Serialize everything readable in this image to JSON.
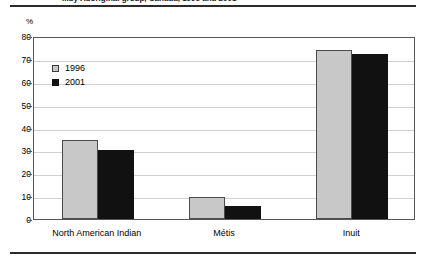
{
  "figure": {
    "title": "...by Aboriginal group, Canada, 1996 and 2001",
    "y_unit": "%"
  },
  "legend": {
    "entries": [
      {
        "label": "1996",
        "color": "#c8c8c8",
        "swatch": "gray-square-icon"
      },
      {
        "label": "2001",
        "color": "#111111",
        "swatch": "black-square-icon"
      }
    ]
  },
  "y_axis": {
    "ticks": [
      "0",
      "10",
      "20",
      "30",
      "40",
      "50",
      "60",
      "70",
      "80"
    ]
  },
  "chart_data": {
    "type": "bar",
    "title": "...by Aboriginal group, Canada, 1996 and 2001",
    "xlabel": "",
    "ylabel": "%",
    "ylim": [
      0,
      80
    ],
    "ytick_step": 10,
    "grid": true,
    "legend_position": "upper-left-inside",
    "categories": [
      "North American Indian",
      "Métis",
      "Inuit"
    ],
    "series": [
      {
        "name": "1996",
        "color": "#c8c8c8",
        "values": [
          34.5,
          9.5,
          74
        ]
      },
      {
        "name": "2001",
        "color": "#111111",
        "values": [
          30,
          5.5,
          72
        ]
      }
    ]
  }
}
